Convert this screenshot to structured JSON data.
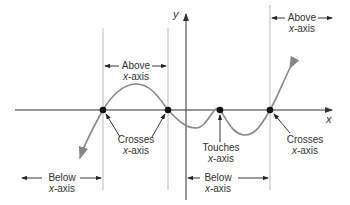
{
  "diagram": {
    "axes": {
      "x_label": "x",
      "y_label": "y"
    },
    "colors": {
      "axis": "#333333",
      "curve": "#888888",
      "guide": "#bbbbbb",
      "point": "#111111"
    },
    "points": [
      {
        "name": "crosses-1",
        "x": 103,
        "y": 110
      },
      {
        "name": "crosses-2",
        "x": 168,
        "y": 110
      },
      {
        "name": "touches",
        "x": 220,
        "y": 110
      },
      {
        "name": "crosses-3",
        "x": 270,
        "y": 110
      }
    ],
    "labels": {
      "above_left": {
        "line1": "Above",
        "line2_var": "x",
        "line2_rest": "-axis"
      },
      "above_right": {
        "line1": "Above",
        "line2_var": "x",
        "line2_rest": "-axis"
      },
      "crosses_left": {
        "line1": "Crosses",
        "line2_var": "x",
        "line2_rest": "-axis"
      },
      "touches": {
        "line1": "Touches",
        "line2_var": "x",
        "line2_rest": "-axis"
      },
      "crosses_right": {
        "line1": "Crosses",
        "line2_var": "x",
        "line2_rest": "-axis"
      },
      "below_left": {
        "line1": "Below",
        "line2_var": "x",
        "line2_rest": "-axis"
      },
      "below_right": {
        "line1": "Below",
        "line2_var": "x",
        "line2_rest": "-axis"
      }
    }
  }
}
